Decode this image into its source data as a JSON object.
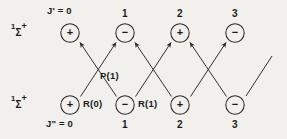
{
  "figure": {
    "type": "energy-level-transition-diagram",
    "background_color": "#f1f0ed",
    "line_color": "#262626",
    "text_color": "#1b1b1b",
    "upper_state": {
      "term_symbol": {
        "multiplicity": "1",
        "letter": "Σ",
        "parity": "+"
      },
      "quantum_number_label": "J' = 0",
      "levels": [
        {
          "j": "0",
          "parity_sign": "+",
          "tick_label": ""
        },
        {
          "j": "1",
          "parity_sign": "−",
          "tick_label": "1"
        },
        {
          "j": "2",
          "parity_sign": "+",
          "tick_label": "2"
        },
        {
          "j": "3",
          "parity_sign": "−",
          "tick_label": "3"
        }
      ]
    },
    "lower_state": {
      "term_symbol": {
        "multiplicity": "1",
        "letter": "Σ",
        "parity": "+"
      },
      "quantum_number_label": "J\" = 0",
      "levels": [
        {
          "j": "0",
          "parity_sign": "+",
          "tick_label": ""
        },
        {
          "j": "1",
          "parity_sign": "−",
          "tick_label": "1"
        },
        {
          "j": "2",
          "parity_sign": "+",
          "tick_label": "2"
        },
        {
          "j": "3",
          "parity_sign": "−",
          "tick_label": "3"
        }
      ]
    },
    "transition_labels": [
      {
        "name": "R(0)",
        "text": "R(0)"
      },
      {
        "name": "P(1)",
        "text": "P(1)"
      },
      {
        "name": "R(1)",
        "text": "R(1)"
      }
    ]
  }
}
